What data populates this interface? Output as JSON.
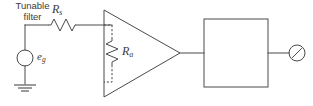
{
  "diagram": {
    "stroke_color": "#4a4a4a",
    "background_color": "#ffffff",
    "labels": {
      "source": {
        "symbol": "e",
        "subscript": "g"
      },
      "series_resistor": {
        "symbol": "R",
        "subscript": "s"
      },
      "amplifier_resistor": {
        "symbol": "R",
        "subscript": "a"
      },
      "filter_line1": "Tunable",
      "filter_line2": "filter"
    },
    "components": [
      {
        "name": "voltage-source",
        "type": "circle-source",
        "label": "eg"
      },
      {
        "name": "ground",
        "type": "earth-ground",
        "bars": 3
      },
      {
        "name": "series-resistor",
        "type": "resistor-zigzag",
        "orientation": "horizontal",
        "label": "Rs"
      },
      {
        "name": "amplifier",
        "type": "triangle",
        "orientation": "right"
      },
      {
        "name": "amplifier-input-resistor",
        "type": "resistor-zigzag",
        "orientation": "vertical",
        "label": "Ra",
        "lead_style": "dashed"
      },
      {
        "name": "tunable-filter",
        "type": "box",
        "label": "Tunable filter"
      },
      {
        "name": "meter",
        "type": "circle-meter-needle"
      }
    ]
  }
}
